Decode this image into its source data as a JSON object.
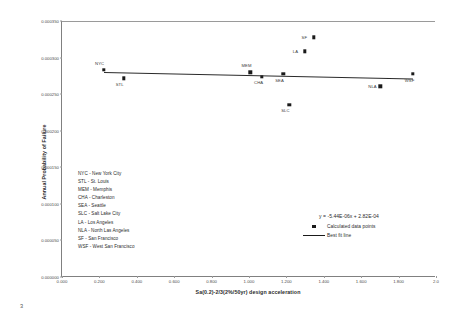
{
  "page": {
    "number": "3"
  },
  "chart_data": {
    "type": "scatter",
    "title": "",
    "xlabel": "Sa(0.2)-2/3(2%/50yr) design acceleration",
    "ylabel": "Annual Probability of Failure",
    "xlim": [
      0.0,
      2.0
    ],
    "ylim": [
      0.0,
      0.00035
    ],
    "xticks": [
      "0.000",
      "0.200",
      "0.400",
      "0.600",
      "0.800",
      "1.000",
      "1.200",
      "1.400",
      "1.600",
      "1.800",
      "2.0"
    ],
    "yticks": [
      "0.000000",
      "0.000050",
      "0.000100",
      "0.000150",
      "0.000200",
      "0.000250",
      "0.000300",
      "0.000350"
    ],
    "grid": false,
    "points": [
      {
        "code": "NYC",
        "x": 0.225,
        "y": 0.0002835,
        "label_pos": "above-left"
      },
      {
        "code": "STL",
        "x": 0.33,
        "y": 0.0002715,
        "label_pos": "below-left"
      },
      {
        "code": "MEM",
        "x": 1.008,
        "y": 0.00028,
        "label_pos": "above-left"
      },
      {
        "code": "CHA",
        "x": 1.07,
        "y": 0.000274,
        "label_pos": "below-left"
      },
      {
        "code": "SEA",
        "x": 1.183,
        "y": 0.0002775,
        "label_pos": "below-left"
      },
      {
        "code": "SLC",
        "x": 1.215,
        "y": 0.0002355,
        "label_pos": "below-left"
      },
      {
        "code": "LA",
        "x": 1.298,
        "y": 0.0003085,
        "label_pos": "left"
      },
      {
        "code": "SF",
        "x": 1.345,
        "y": 0.0003275,
        "label_pos": "left"
      },
      {
        "code": "NLA",
        "x": 1.702,
        "y": 0.0002605,
        "label_pos": "left"
      },
      {
        "code": "WSF",
        "x": 1.876,
        "y": 0.0002775,
        "label_pos": "below-left"
      }
    ],
    "fit_line": {
      "equation": "y = -5.44E-06x + 2.82E-04",
      "slope": -5.44e-06,
      "intercept": 0.000282,
      "x_start": 0.225,
      "x_end": 1.876
    },
    "legend": {
      "position": "inside-bottom-right",
      "entries": [
        {
          "marker": "square",
          "label": "Calculated data points"
        },
        {
          "marker": "line",
          "label": "Best fit line"
        }
      ]
    },
    "city_key": [
      "NYC - New York City",
      "STL  - St. Louis",
      "MEM - Memphis",
      "CHA - Charleston",
      "SEA - Seattle",
      "SLC - Salt Lake City",
      "LA - Los Angeles",
      "NLA - North Las Angeles",
      "SF - San Francisco",
      "WSF - West San Francisco"
    ]
  },
  "colors": {
    "marker": "#1a1a1a",
    "fit_line": "#2a2a2a",
    "axis": "#808080",
    "text": "#2b2b2b"
  }
}
